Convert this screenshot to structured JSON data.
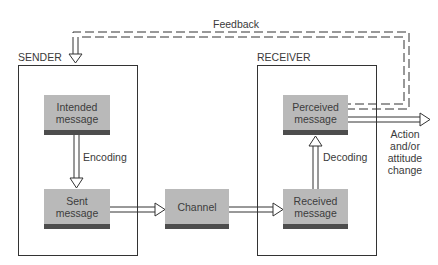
{
  "diagram": {
    "type": "communication-process-model",
    "groups": {
      "sender": {
        "label": "SENDER"
      },
      "receiver": {
        "label": "RECEIVER"
      }
    },
    "nodes": {
      "intended": {
        "line1": "Intended",
        "line2": "message"
      },
      "sent": {
        "line1": "Sent",
        "line2": "message"
      },
      "channel": {
        "line1": "Channel",
        "line2": ""
      },
      "received": {
        "line1": "Received",
        "line2": "message"
      },
      "perceived": {
        "line1": "Perceived",
        "line2": "message"
      }
    },
    "edges": {
      "encoding": {
        "label": "Encoding",
        "from": "Intended message",
        "to": "Sent message"
      },
      "decoding": {
        "label": "Decoding",
        "from": "Received message",
        "to": "Perceived message"
      },
      "feedback": {
        "label": "Feedback",
        "from": "Perceived message",
        "to": "SENDER",
        "style": "dashed"
      },
      "sent_to_channel": {
        "from": "Sent message",
        "to": "Channel"
      },
      "channel_to_received": {
        "from": "Channel",
        "to": "Received message"
      },
      "outcome": {
        "from": "Perceived message",
        "line1": "Action",
        "line2": "and/or",
        "line3": "attitude",
        "line4": "change"
      }
    },
    "colors": {
      "node_fill": "#b9b9b9",
      "node_strip": "#4d4d4d",
      "line": "#333333"
    }
  }
}
